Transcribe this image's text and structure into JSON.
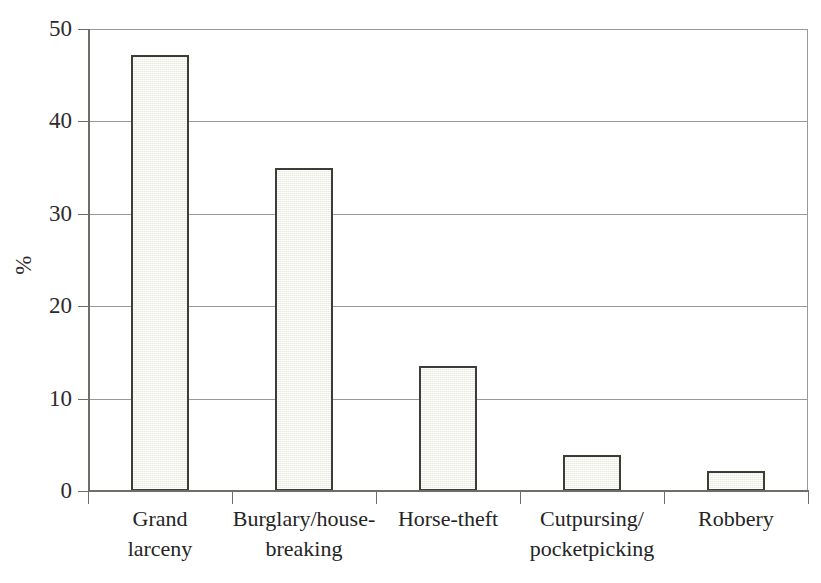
{
  "chart_data": {
    "type": "bar",
    "title": "",
    "subtitle": "",
    "xlabel": "",
    "ylabel": "%",
    "categories": [
      "Grand larceny",
      "Burglary/house-breaking",
      "Horse-theft",
      "Cutpursing/pocketpicking",
      "Robbery"
    ],
    "category_lines": [
      [
        "Grand",
        "larceny"
      ],
      [
        "Burglary/house-",
        "breaking"
      ],
      [
        "Horse-theft",
        ""
      ],
      [
        "Cutpursing/",
        "pocketpicking"
      ],
      [
        "Robbery",
        ""
      ]
    ],
    "values": [
      47.2,
      35.0,
      13.5,
      3.9,
      2.2
    ],
    "ylim": [
      0,
      50
    ],
    "ytick_values": [
      0,
      10,
      20,
      30,
      40,
      50
    ],
    "ytick_labels": [
      "0",
      "10",
      "20",
      "30",
      "40",
      "50"
    ],
    "grid": true,
    "grid_axis": "y",
    "legend": "none",
    "legend_position": "none",
    "colors": {
      "bar_fill": "#e9e9df",
      "bar_border": "#3c3c38",
      "gridline": "#9a9a94",
      "axis_line": "#6e6e68",
      "text": "#242424",
      "background": "#ffffff"
    }
  },
  "axis": {
    "y_title": "%",
    "ticks": [
      {
        "label": "50",
        "value": 50
      },
      {
        "label": "40",
        "value": 40
      },
      {
        "label": "30",
        "value": 30
      },
      {
        "label": "20",
        "value": 20
      },
      {
        "label": "10",
        "value": 10
      },
      {
        "label": "0",
        "value": 0
      }
    ]
  }
}
